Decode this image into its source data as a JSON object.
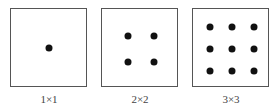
{
  "panels": [
    {
      "label": "1×1",
      "grid": 1,
      "left": 10
    },
    {
      "label": "2×2",
      "grid": 2,
      "left": 101
    },
    {
      "label": "3×3",
      "grid": 3,
      "left": 192
    }
  ],
  "colors": {
    "border": "#555555",
    "dot": "#111111",
    "label": "#444444"
  }
}
